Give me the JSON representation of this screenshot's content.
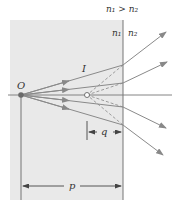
{
  "diagram": {
    "condition_label": "n₁ > n₂",
    "medium1_label": "n₁",
    "medium2_label": "n₂",
    "object_label": "O",
    "image_label": "I",
    "object_distance_label": "p",
    "image_distance_label": "q",
    "colors": {
      "medium1_fill": "#e8e8e8",
      "ray": "#8a8a8a",
      "line": "#555555",
      "dashed": "#888888",
      "object_point": "#6a6a6a"
    }
  }
}
